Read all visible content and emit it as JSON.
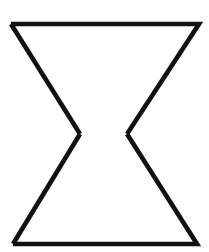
{
  "document": {
    "title": "Hourglass Line Drawing",
    "kind": "line-drawing",
    "description": "Black outline geometric figure resembling an hourglass or bowtie rotated vertically: an upper inverted-trapezoid chevron and a lower trapezoid chevron whose apex tips nearly meet at the center but leave a gap.",
    "width": 209,
    "height": 252
  },
  "canvas": {
    "background_color": "#ffffff",
    "width": 209,
    "height": 252
  },
  "figure": {
    "name": "hourglass-outline",
    "stroke_color": "#111111",
    "stroke_width": 4.6,
    "fill": "none",
    "vertices": {
      "top_left": [
        11,
        24
      ],
      "top_right": [
        199,
        24
      ],
      "pinch_left": [
        80,
        134
      ],
      "pinch_right": [
        127,
        134
      ],
      "bottom_left": [
        13,
        244
      ],
      "bottom_right": [
        197,
        244
      ]
    },
    "segments": [
      {
        "name": "top-edge",
        "from": [
          11,
          24
        ],
        "to": [
          199,
          24
        ],
        "orientation": "horizontal"
      },
      {
        "name": "upper-left-arm",
        "from": [
          11,
          24
        ],
        "to": [
          80,
          134
        ],
        "orientation": "diagonal"
      },
      {
        "name": "upper-right-arm",
        "from": [
          199,
          24
        ],
        "to": [
          127,
          134
        ],
        "orientation": "diagonal"
      },
      {
        "name": "lower-left-arm",
        "from": [
          80,
          134
        ],
        "to": [
          13,
          244
        ],
        "orientation": "diagonal"
      },
      {
        "name": "lower-right-arm",
        "from": [
          127,
          134
        ],
        "to": [
          197,
          244
        ],
        "orientation": "diagonal"
      },
      {
        "name": "bottom-edge",
        "from": [
          13,
          244
        ],
        "to": [
          197,
          244
        ],
        "orientation": "horizontal"
      }
    ],
    "paths": {
      "upper_chevron": "M 11 24 L 199 24 L 127 134",
      "upper_left_arm": "M 11 24 L 80 134",
      "lower_chevron": "M 13 244 L 197 244 L 127 134",
      "lower_left_arm": "M 13 244 L 80 134"
    },
    "center_gap": {
      "left_tip_x": 80,
      "right_tip_x": 127,
      "y": 134,
      "width": 47,
      "connected": false
    }
  }
}
